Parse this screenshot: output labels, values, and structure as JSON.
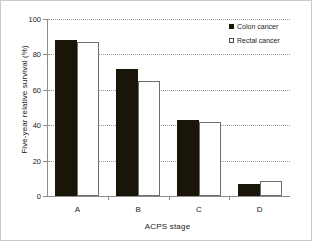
{
  "chart_data": {
    "type": "bar",
    "title": "",
    "subtitle": "",
    "xlabel": "ACPS stage",
    "ylabel": "Five-year relative survival (%)",
    "categories": [
      "A",
      "B",
      "C",
      "D"
    ],
    "series": [
      {
        "name": "Colon cancer",
        "color": "#1a1509",
        "values": [
          88,
          72,
          43,
          7
        ]
      },
      {
        "name": "Rectal cancer",
        "color": "#ffffff",
        "values": [
          87,
          65,
          42,
          8.5
        ]
      }
    ],
    "ylim": [
      0,
      100
    ],
    "yticks": [
      0,
      20,
      40,
      60,
      80,
      100
    ],
    "ytick_labels": [
      "0",
      "20",
      "40",
      "60",
      "80",
      "100"
    ],
    "grid": true,
    "grid_axis": "y",
    "grid_style": "dotted",
    "legend_position": "top-right",
    "annotations": []
  },
  "legend": {
    "items": [
      {
        "label": "Colon cancer",
        "swatch": "filled-square"
      },
      {
        "label": "Rectal cancer",
        "swatch": "open-square"
      }
    ]
  },
  "axes": {
    "y_title": "Five-year relative survival (%)",
    "x_title": "ACPS stage",
    "y_ticks": [
      "0",
      "20",
      "40",
      "60",
      "80",
      "100"
    ],
    "x_ticks": [
      "A",
      "B",
      "C",
      "D"
    ]
  },
  "colors": {
    "colon": "#1a1509",
    "rectal_fill": "#ffffff",
    "rectal_edge": "#6e6e6e",
    "axis": "#8c8c8c",
    "grid": "#9a9a9a",
    "text": "#1a1a1a",
    "frame": "#c9c9c9",
    "background": "#ffffff"
  }
}
